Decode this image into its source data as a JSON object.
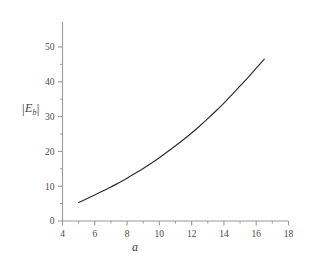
{
  "chart_data": {
    "type": "line",
    "title": "",
    "subtitle": "",
    "xlabel": "a",
    "ylabel": "|E_b|",
    "ylabel_parts": {
      "open_bar": "|",
      "symbol": "E",
      "subscript": "b",
      "close_bar": "|"
    },
    "xlim": [
      4,
      18
    ],
    "ylim": [
      0,
      54
    ],
    "xticks": [
      4,
      6,
      8,
      10,
      12,
      14,
      16,
      18
    ],
    "xtick_labels": [
      "4",
      "6",
      "8",
      "10",
      "12",
      "14",
      "16",
      "18"
    ],
    "yticks": [
      0,
      10,
      20,
      30,
      40,
      50
    ],
    "ytick_labels": [
      "0",
      "10",
      "20",
      "30",
      "40",
      "50"
    ],
    "minor_xticks": [
      5,
      7,
      9,
      11,
      13,
      15,
      17
    ],
    "minor_yticks": [
      5,
      15,
      25,
      35,
      45
    ],
    "grid": false,
    "legend": false,
    "axis_color": "#9a9a9a",
    "curve_color": "#2b2b2b",
    "background_color": "#ffffff",
    "series": [
      {
        "name": "|E_b|(a)",
        "x": [
          5.0,
          5.5,
          6.0,
          6.5,
          7.0,
          7.5,
          8.0,
          8.5,
          9.0,
          9.5,
          10.0,
          10.5,
          11.0,
          11.5,
          12.0,
          12.5,
          13.0,
          13.5,
          14.0,
          14.5,
          15.0,
          15.5,
          16.0,
          16.5
        ],
        "values": [
          5.3,
          6.4,
          7.5,
          8.6,
          9.8,
          11.0,
          12.3,
          13.7,
          15.1,
          16.6,
          18.2,
          19.9,
          21.6,
          23.4,
          25.3,
          27.3,
          29.4,
          31.6,
          33.9,
          36.3,
          38.8,
          41.3,
          43.9,
          46.5
        ]
      }
    ]
  },
  "figure": {
    "axis_label_x": "a",
    "axis_label_y_open": "|",
    "axis_label_y_symbol": "E",
    "axis_label_y_sub": "b",
    "axis_label_y_close": "|"
  }
}
